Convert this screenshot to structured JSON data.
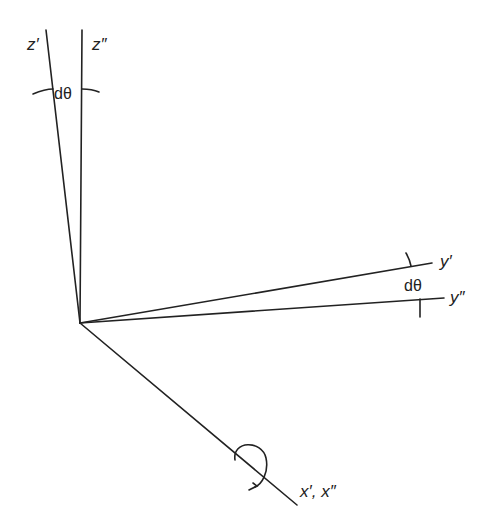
{
  "diagram": {
    "type": "coordinate-axes-rotation",
    "labels": {
      "z_prime": "z′",
      "z_double_prime": "z″",
      "y_prime": "y′",
      "y_double_prime": "y″",
      "x_axes": "x′, x″",
      "angle_top": "dθ",
      "angle_right": "dθ"
    },
    "colors": {
      "line": "#222222",
      "background": "#ffffff"
    }
  }
}
